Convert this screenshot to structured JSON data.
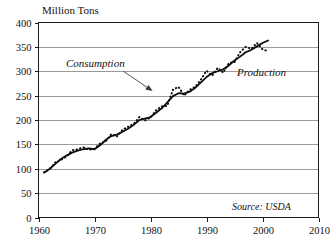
{
  "chart_data": {
    "type": "line",
    "title": "Million Tons",
    "xlabel": "",
    "ylabel": "Million Tons",
    "xlim": [
      1960,
      2010
    ],
    "ylim": [
      0,
      400
    ],
    "xticks": [
      1960,
      1970,
      1980,
      1990,
      2000,
      2010
    ],
    "yticks": [
      0,
      50,
      100,
      150,
      200,
      250,
      300,
      350,
      400
    ],
    "grid": true,
    "legend_position": "inline-annotations",
    "annotations": [
      {
        "name": "consumption",
        "text": "Consumption",
        "style": "italic",
        "x": 1968.5,
        "y": 318,
        "arrow_to_x": 1979.0,
        "arrow_to_y": 258
      },
      {
        "name": "production",
        "text": "Production",
        "style": "italic",
        "x": 1993.2,
        "y": 300
      },
      {
        "name": "source",
        "text": "Source: USDA",
        "style": "italic",
        "x": 1995.0,
        "y": 27
      }
    ],
    "series": [
      {
        "name": "Consumption",
        "style": "solid",
        "x": [
          1961,
          1962,
          1963,
          1964,
          1965,
          1966,
          1967,
          1968,
          1969,
          1970,
          1971,
          1972,
          1973,
          1974,
          1975,
          1976,
          1977,
          1978,
          1979,
          1980,
          1981,
          1982,
          1983,
          1984,
          1985,
          1986,
          1987,
          1988,
          1989,
          1990,
          1991,
          1992,
          1993,
          1994,
          1995,
          1996,
          1997,
          1998,
          1999,
          2000,
          2001
        ],
        "values": [
          92,
          100,
          110,
          120,
          127,
          133,
          137,
          140,
          142,
          140,
          148,
          159,
          167,
          170,
          176,
          182,
          190,
          200,
          203,
          206,
          215,
          224,
          236,
          249,
          255,
          254,
          258,
          266,
          277,
          288,
          296,
          300,
          304,
          312,
          322,
          330,
          339,
          344,
          351,
          358,
          363
        ]
      },
      {
        "name": "Production",
        "style": "dotted",
        "x": [
          1961,
          1962,
          1963,
          1964,
          1965,
          1966,
          1967,
          1968,
          1969,
          1970,
          1971,
          1972,
          1973,
          1974,
          1975,
          1976,
          1977,
          1978,
          1979,
          1980,
          1981,
          1982,
          1983,
          1984,
          1985,
          1986,
          1987,
          1988,
          1989,
          1990,
          1991,
          1992,
          1993,
          1994,
          1995,
          1996,
          1997,
          1998,
          1999,
          2000,
          2001
        ],
        "values": [
          93,
          99,
          113,
          118,
          125,
          138,
          140,
          144,
          139,
          141,
          152,
          156,
          171,
          166,
          180,
          186,
          192,
          206,
          199,
          205,
          220,
          228,
          229,
          262,
          268,
          250,
          262,
          268,
          283,
          301,
          291,
          307,
          297,
          317,
          319,
          339,
          350,
          346,
          358,
          345,
          341
        ]
      }
    ]
  },
  "figure": {
    "background_color": "#ffffff",
    "grid_color": "#9a9a9a",
    "line_color": "#0d0d0d"
  }
}
